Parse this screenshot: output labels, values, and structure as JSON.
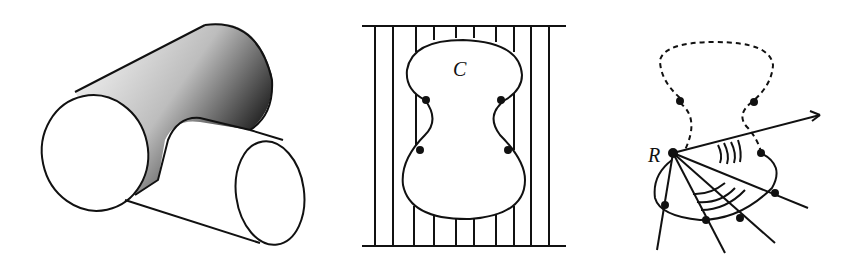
{
  "figure": {
    "panels": [
      {
        "id": "intersecting-cylinders",
        "description": "Two intersecting cylinders with shaded intersection region"
      },
      {
        "id": "region-with-lines",
        "label": "C",
        "description": "Peanut-shaped region C crossed by parallel vertical lines between two horizontal lines"
      },
      {
        "id": "radial-sweep",
        "label": "R",
        "description": "Point R with rays sweeping across a curve, dashed upper portion, arcs marking angles"
      }
    ],
    "colors": {
      "stroke": "#111111",
      "background": "#ffffff"
    }
  }
}
